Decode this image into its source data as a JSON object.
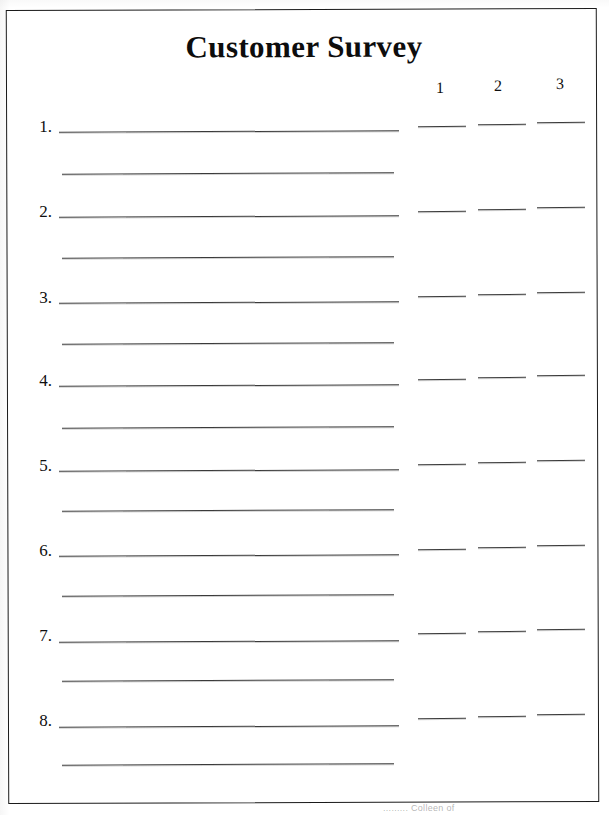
{
  "document": {
    "title": "Customer Survey",
    "type": "printable-survey-form",
    "page_border": true,
    "border_color": "#1a1a1a",
    "background_color": "#ffffff",
    "ink_color": "#3a3a3a"
  },
  "rating_columns": {
    "headers": [
      "1",
      "2",
      "3"
    ],
    "count": 3
  },
  "items": [
    {
      "number": "1."
    },
    {
      "number": "2."
    },
    {
      "number": "3."
    },
    {
      "number": "4."
    },
    {
      "number": "5."
    },
    {
      "number": "6."
    },
    {
      "number": "7."
    },
    {
      "number": "8."
    }
  ],
  "footer": {
    "watermark_text": "......... Colleen of"
  }
}
